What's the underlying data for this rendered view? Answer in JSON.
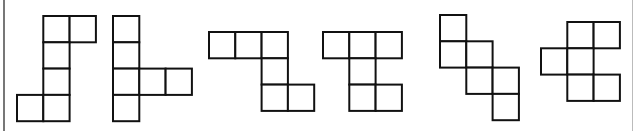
{
  "diagram": {
    "title": "",
    "stroke_color": "#111111",
    "fill_color": "#ffffff",
    "cell_size": 26.3,
    "figures": [
      {
        "id": 1,
        "origin": [
          17,
          16
        ],
        "cells": [
          [
            1,
            0
          ],
          [
            2,
            0
          ],
          [
            1,
            1
          ],
          [
            1,
            2
          ],
          [
            0,
            3
          ],
          [
            1,
            3
          ]
        ]
      },
      {
        "id": 2,
        "origin": [
          113,
          16
        ],
        "cells": [
          [
            0,
            0
          ],
          [
            0,
            1
          ],
          [
            0,
            2
          ],
          [
            1,
            2
          ],
          [
            2,
            2
          ],
          [
            0,
            3
          ]
        ]
      },
      {
        "id": 3,
        "origin": [
          209,
          32
        ],
        "cells": [
          [
            0,
            0
          ],
          [
            1,
            0
          ],
          [
            2,
            0
          ],
          [
            2,
            1
          ],
          [
            2,
            2
          ],
          [
            3,
            2
          ]
        ]
      },
      {
        "id": 4,
        "origin": [
          323,
          32
        ],
        "cells": [
          [
            0,
            0
          ],
          [
            1,
            0
          ],
          [
            2,
            0
          ],
          [
            1,
            1
          ],
          [
            1,
            2
          ],
          [
            2,
            2
          ]
        ]
      },
      {
        "id": 5,
        "origin": [
          440,
          15
        ],
        "cells": [
          [
            0,
            0
          ],
          [
            0,
            1
          ],
          [
            1,
            1
          ],
          [
            1,
            2
          ],
          [
            2,
            2
          ],
          [
            2,
            3
          ]
        ]
      },
      {
        "id": 6,
        "origin": [
          541,
          22
        ],
        "cells": [
          [
            1,
            0
          ],
          [
            2,
            0
          ],
          [
            0,
            1
          ],
          [
            1,
            1
          ],
          [
            1,
            2
          ],
          [
            2,
            2
          ]
        ]
      }
    ]
  }
}
